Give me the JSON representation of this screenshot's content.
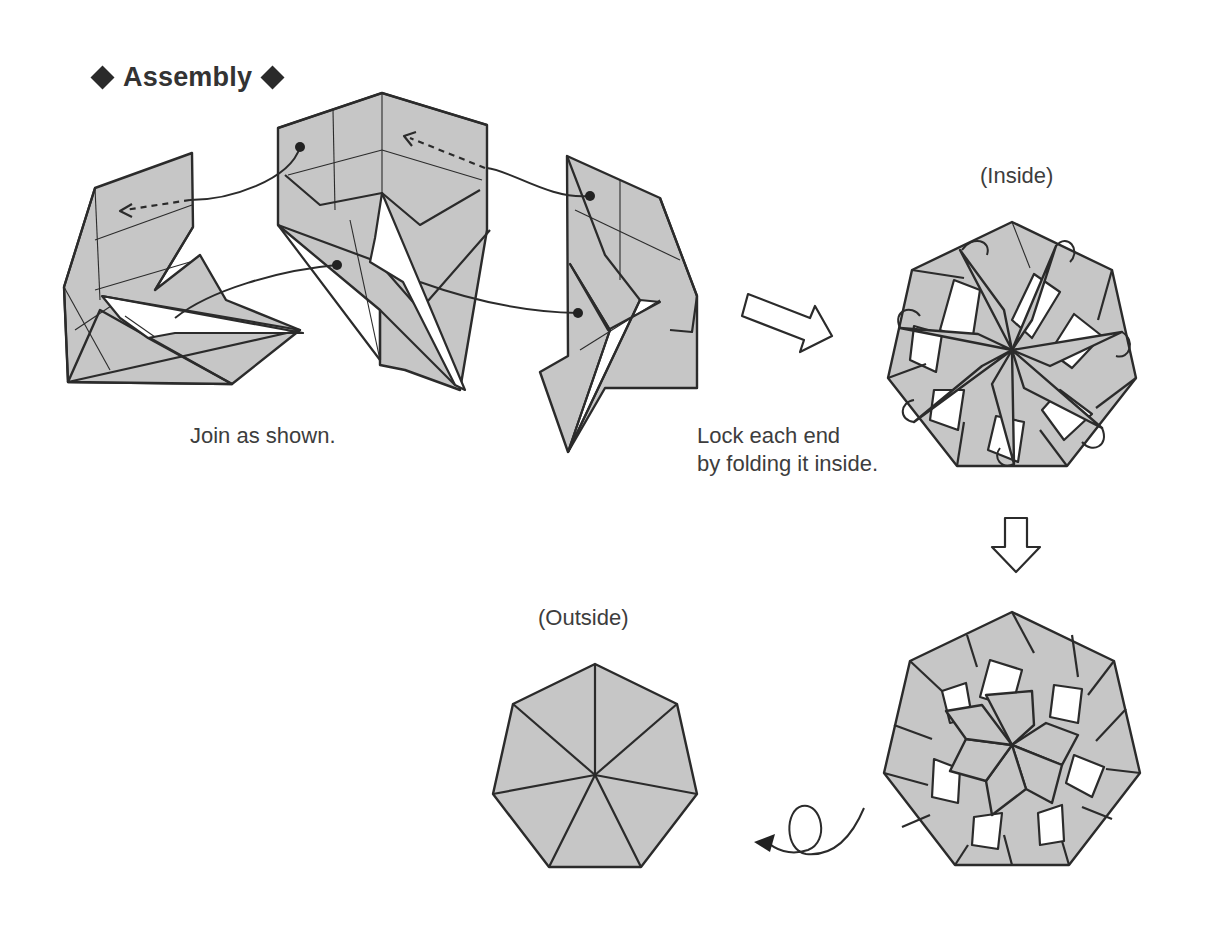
{
  "title": {
    "text": "Assembly",
    "left_symbol": "diamond-icon",
    "right_symbol": "diamond-icon"
  },
  "steps": [
    {
      "id": "join",
      "caption": "Join as shown."
    },
    {
      "id": "lock",
      "caption_lines": [
        "Lock each end",
        "by folding it inside."
      ]
    }
  ],
  "views": {
    "inside_label": "(Inside)",
    "outside_label": "(Outside)"
  },
  "arrows": {
    "right_arrow": "hollow-arrow-right-icon",
    "down_arrow": "hollow-arrow-down-icon",
    "turn_over": "turn-over-arrow-icon"
  },
  "colors": {
    "paper": "#c6c6c6",
    "line": "#2b2b2b",
    "background": "#ffffff",
    "text": "#3d3d3d"
  }
}
